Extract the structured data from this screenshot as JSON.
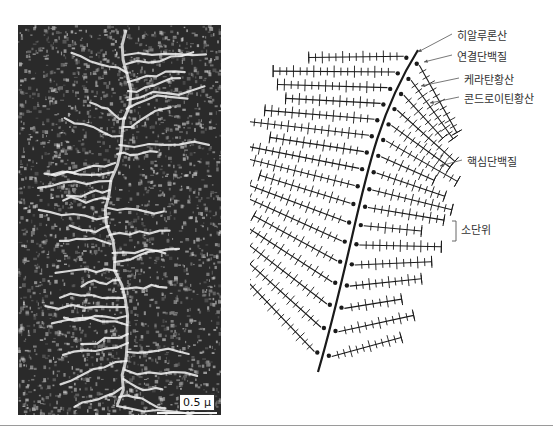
{
  "figure": {
    "micrograph": {
      "description": "Electron micrograph of proteoglycan aggregate",
      "scale_bar_label": "0.5 μ"
    },
    "diagram": {
      "labels": [
        {
          "id": "hyaluronic-acid",
          "text": "히알루론산",
          "x": 457,
          "y": 34,
          "arrow_to": [
            418,
            52
          ]
        },
        {
          "id": "link-protein",
          "text": "연결단백질",
          "x": 457,
          "y": 55,
          "arrow_to": [
            424,
            62
          ]
        },
        {
          "id": "keratan-sulfate",
          "text": "케라탄황산",
          "x": 464,
          "y": 78,
          "arrow_to": [
            421,
            86
          ]
        },
        {
          "id": "chondroitin-sulfate",
          "text": "콘드로이틴황산",
          "x": 464,
          "y": 97,
          "arrow_to": [
            430,
            103
          ]
        },
        {
          "id": "core-protein",
          "text": "핵심단백질",
          "x": 467,
          "y": 160,
          "arrow_to": [
            440,
            166
          ]
        },
        {
          "id": "subunit",
          "text": "소단위",
          "x": 461,
          "y": 228,
          "bracket": [
            452,
            221,
            241
          ]
        }
      ]
    }
  },
  "colors": {
    "ink": "#1a1a1a",
    "label_text": "#333333",
    "arrow": "#555555",
    "divider": "#9a9a9a"
  }
}
